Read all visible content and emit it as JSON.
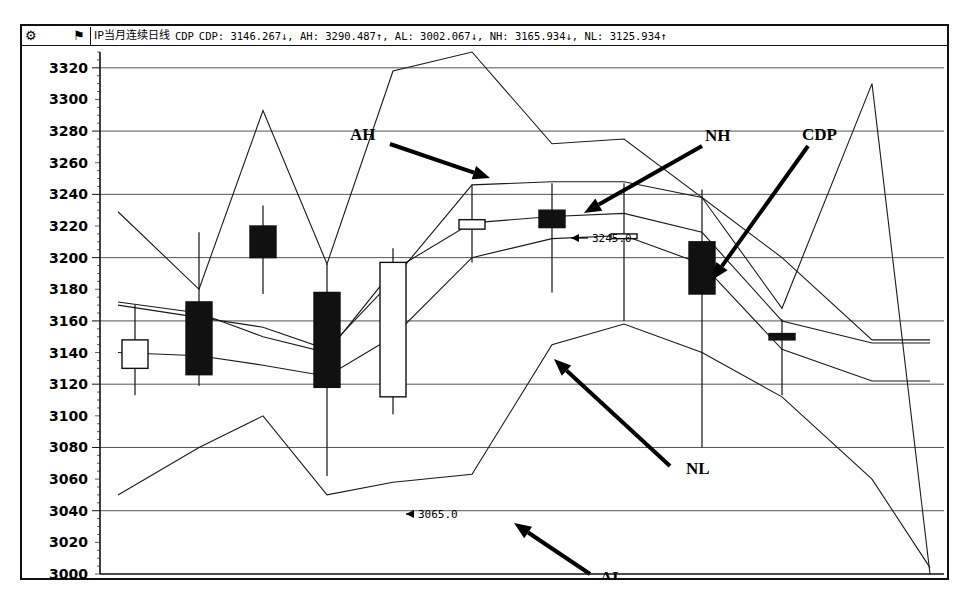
{
  "window": {
    "title_cn": "IP当月连续日线",
    "indicator": "CDP",
    "icons": {
      "gear": "gear-icon",
      "flag": "flag-icon"
    },
    "readout": "CDP: 3146.267↓, AH: 3290.487↑, AL: 3002.067↓, NH: 3165.934↓, NL: 3125.934↑",
    "readout_parts": [
      {
        "key": "CDP",
        "value": "3146.267",
        "dir": "↓"
      },
      {
        "key": "AH",
        "value": "3290.487",
        "dir": "↑"
      },
      {
        "key": "AL",
        "value": "3002.067",
        "dir": "↓"
      },
      {
        "key": "NH",
        "value": "3165.934",
        "dir": "↓"
      },
      {
        "key": "NL",
        "value": "3125.934",
        "dir": "↑"
      }
    ]
  },
  "annotations": [
    {
      "name": "AH",
      "label": "AH",
      "x": 328,
      "y": 94,
      "ax0": 368,
      "ay0": 98,
      "ax1": 468,
      "ay1": 132
    },
    {
      "name": "NH",
      "label": "NH",
      "x": 683,
      "y": 95,
      "ax0": 680,
      "ay0": 100,
      "ax1": 562,
      "ay1": 167
    },
    {
      "name": "CDP",
      "label": "CDP",
      "x": 780,
      "y": 94,
      "ax0": 786,
      "ay0": 100,
      "ax1": 690,
      "ay1": 234
    },
    {
      "name": "NL",
      "label": "NL",
      "x": 664,
      "y": 428,
      "ax0": 648,
      "ay0": 420,
      "ax1": 532,
      "ay1": 313
    },
    {
      "name": "AL",
      "label": "AL",
      "x": 578,
      "y": 537,
      "ax0": 568,
      "ay0": 528,
      "ax1": 492,
      "ay1": 477
    }
  ],
  "value_callouts": [
    {
      "name": "cdp-high-callout",
      "text": "3245.0",
      "x": 570,
      "y": 196,
      "tip_x": 549,
      "tip_y": 192
    },
    {
      "name": "cdp-low-callout",
      "text": "3065.0",
      "x": 396,
      "y": 472,
      "tip_x": 384,
      "tip_y": 468
    }
  ],
  "chart_data": {
    "type": "line",
    "title": "IP当月连续日线 CDP",
    "xlabel": "",
    "ylabel": "",
    "ylim": [
      3000,
      3330
    ],
    "grid": true,
    "legend_position": "none",
    "yticks": [
      3000,
      3020,
      3040,
      3060,
      3080,
      3100,
      3120,
      3140,
      3160,
      3180,
      3200,
      3220,
      3240,
      3260,
      3280,
      3300,
      3320
    ],
    "major_gridlines": [
      3040,
      3080,
      3120,
      3160,
      3200,
      3240,
      3280,
      3320
    ],
    "candles": [
      {
        "x": 113,
        "open": 3130,
        "high": 3170,
        "low": 3113,
        "close": 3148,
        "dir": "up"
      },
      {
        "x": 177,
        "open": 3126,
        "high": 3216,
        "low": 3119,
        "close": 3172,
        "dir": "down"
      },
      {
        "x": 241,
        "open": 3220,
        "high": 3233,
        "low": 3177,
        "close": 3200,
        "dir": "down"
      },
      {
        "x": 305,
        "open": 3178,
        "high": 3196,
        "low": 3062,
        "close": 3118,
        "dir": "down"
      },
      {
        "x": 371,
        "open": 3112,
        "high": 3206,
        "low": 3101,
        "close": 3197,
        "dir": "up"
      },
      {
        "x": 450,
        "open": 3224,
        "high": 3246,
        "low": 3197,
        "close": 3218,
        "dir": "up"
      },
      {
        "x": 530,
        "open": 3230,
        "high": 3247,
        "low": 3178,
        "close": 3219,
        "dir": "down"
      },
      {
        "x": 602,
        "open": 3215,
        "high": 3247,
        "low": 3160,
        "close": 3212,
        "dir": "up"
      },
      {
        "x": 680,
        "open": 3210,
        "high": 3243,
        "low": 3080,
        "close": 3177,
        "dir": "down"
      },
      {
        "x": 760,
        "open": 3152,
        "high": 3161,
        "low": 3113,
        "close": 3148,
        "dir": "down"
      }
    ],
    "series": [
      {
        "name": "AH",
        "points": [
          [
            96,
            3229
          ],
          [
            177,
            3180
          ],
          [
            241,
            3293
          ],
          [
            305,
            3196
          ],
          [
            371,
            3318
          ],
          [
            450,
            3330
          ],
          [
            530,
            3272
          ],
          [
            602,
            3275
          ],
          [
            680,
            3238
          ],
          [
            760,
            3168
          ],
          [
            850,
            3310
          ],
          [
            908,
            3000
          ]
        ]
      },
      {
        "name": "AL",
        "points": [
          [
            96,
            3050
          ],
          [
            177,
            3080
          ],
          [
            241,
            3100
          ],
          [
            305,
            3050
          ],
          [
            371,
            3058
          ],
          [
            450,
            3063
          ],
          [
            530,
            3145
          ],
          [
            602,
            3158
          ],
          [
            680,
            3140
          ],
          [
            760,
            3112
          ],
          [
            850,
            3060
          ],
          [
            908,
            3004
          ]
        ]
      },
      {
        "name": "CDP",
        "points": [
          [
            96,
            3170
          ],
          [
            241,
            3156
          ],
          [
            305,
            3142
          ],
          [
            371,
            3186
          ],
          [
            450,
            3246
          ],
          [
            530,
            3248
          ],
          [
            602,
            3248
          ],
          [
            680,
            3238
          ],
          [
            760,
            3200
          ],
          [
            850,
            3148
          ],
          [
            908,
            3148
          ]
        ]
      },
      {
        "name": "NH",
        "points": [
          [
            96,
            3172
          ],
          [
            177,
            3165
          ],
          [
            241,
            3150
          ],
          [
            305,
            3140
          ],
          [
            371,
            3192
          ],
          [
            450,
            3222
          ],
          [
            530,
            3226
          ],
          [
            602,
            3228
          ],
          [
            680,
            3216
          ],
          [
            760,
            3160
          ],
          [
            850,
            3146
          ],
          [
            908,
            3146
          ]
        ]
      },
      {
        "name": "NL",
        "points": [
          [
            96,
            3140
          ],
          [
            177,
            3138
          ],
          [
            241,
            3132
          ],
          [
            305,
            3125
          ],
          [
            371,
            3150
          ],
          [
            450,
            3200
          ],
          [
            530,
            3212
          ],
          [
            602,
            3214
          ],
          [
            680,
            3196
          ],
          [
            760,
            3142
          ],
          [
            850,
            3122
          ],
          [
            908,
            3122
          ]
        ]
      }
    ]
  }
}
